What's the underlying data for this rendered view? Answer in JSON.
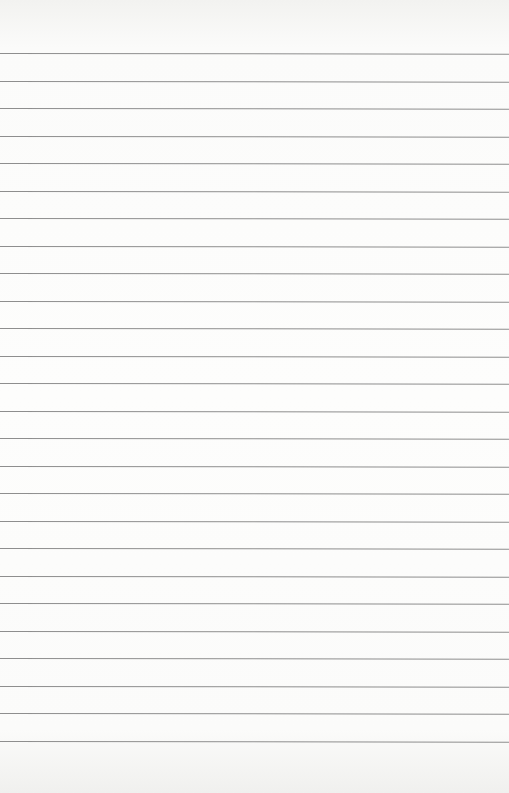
{
  "paper": {
    "type": "lined-paper",
    "background": "#fdfdfc",
    "line_color": "#8e8e8e",
    "line_count": 26,
    "first_line_y": 53,
    "line_spacing": 27.5
  }
}
